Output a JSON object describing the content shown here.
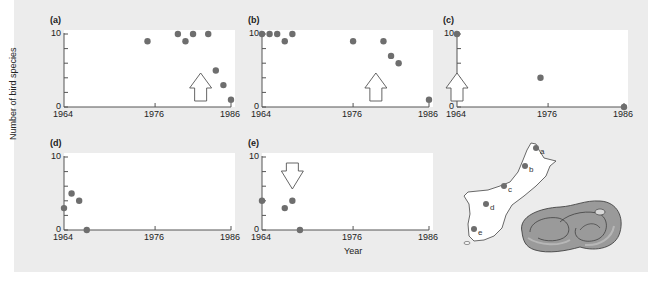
{
  "figure": {
    "ylabel": "Number of bird species",
    "xlabel": "Year",
    "colors": {
      "background": "#ececec",
      "plot": "#ffffff",
      "point": "#6e6e6e",
      "axis": "#555555"
    }
  },
  "chart_data": [
    {
      "type": "scatter",
      "panel": "(a)",
      "x": [
        1975,
        1979,
        1980,
        1981,
        1983,
        1984,
        1985,
        1986
      ],
      "y": [
        9,
        10,
        9,
        10,
        10,
        5,
        3,
        1
      ],
      "annotation": {
        "type": "arrow-up",
        "year": 1982
      },
      "xlim": [
        1964,
        1986
      ],
      "ylim": [
        0,
        10
      ],
      "xticks": [
        "1964",
        "1976",
        "1986"
      ],
      "yticks": [
        "0",
        "10"
      ]
    },
    {
      "type": "scatter",
      "panel": "(b)",
      "x": [
        1964,
        1965,
        1966,
        1967,
        1968,
        1976,
        1980,
        1981,
        1982,
        1986
      ],
      "y": [
        10,
        10,
        10,
        9,
        10,
        9,
        9,
        7,
        6,
        1
      ],
      "annotation": {
        "type": "arrow-up",
        "year": 1979
      },
      "xlim": [
        1964,
        1986
      ],
      "ylim": [
        0,
        10
      ],
      "xticks": [
        "1964",
        "1976",
        "1986"
      ],
      "yticks": [
        "0",
        "10"
      ]
    },
    {
      "type": "scatter",
      "panel": "(c)",
      "x": [
        1964,
        1975,
        1986
      ],
      "y": [
        10,
        4,
        0
      ],
      "annotation": {
        "type": "arrow-up",
        "year": 1964
      },
      "xlim": [
        1964,
        1986
      ],
      "ylim": [
        0,
        10
      ],
      "xticks": [
        "1964",
        "1976",
        "1986"
      ],
      "yticks": [
        "0",
        "10"
      ]
    },
    {
      "type": "scatter",
      "panel": "(d)",
      "x": [
        1964,
        1965,
        1966,
        1967
      ],
      "y": [
        3,
        5,
        4,
        0
      ],
      "xlim": [
        1964,
        1986
      ],
      "ylim": [
        0,
        10
      ],
      "xticks": [
        "1964",
        "1976",
        "1986"
      ],
      "yticks": [
        "0",
        "10"
      ]
    },
    {
      "type": "scatter",
      "panel": "(e)",
      "x": [
        1964,
        1967,
        1968,
        1969
      ],
      "y": [
        4,
        3,
        4,
        0
      ],
      "annotation": {
        "type": "arrow-down",
        "year": 1968
      },
      "xlim": [
        1964,
        1986
      ],
      "ylim": [
        0,
        10
      ],
      "xticks": [
        "1964",
        "1976",
        "1986"
      ],
      "yticks": [
        "0",
        "10"
      ]
    }
  ],
  "map": {
    "sites": [
      {
        "label": "a",
        "x": 536,
        "y": 148
      },
      {
        "label": "b",
        "x": 525,
        "y": 166
      },
      {
        "label": "c",
        "x": 504,
        "y": 186
      },
      {
        "label": "d",
        "x": 486,
        "y": 204
      },
      {
        "label": "e",
        "x": 474,
        "y": 229
      }
    ]
  }
}
